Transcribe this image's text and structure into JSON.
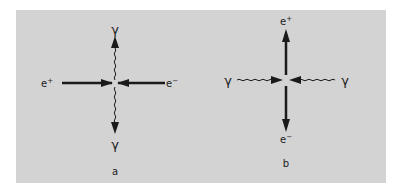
{
  "figure": {
    "background_color": "#d3d3d3",
    "ink_color": "#1a1a1a",
    "panels": [
      {
        "id": "a",
        "caption": "a",
        "description": "Electron-positron annihilation into two photons",
        "labels": {
          "left": "e",
          "left_sup": "+",
          "right": "e",
          "right_sup": "−",
          "top": "γ",
          "bottom": "γ"
        }
      },
      {
        "id": "b",
        "caption": "b",
        "description": "Two photons producing an electron-positron pair",
        "labels": {
          "left": "γ",
          "right": "γ",
          "top": "e",
          "top_sup": "+",
          "bottom": "e",
          "bottom_sup": "−"
        }
      }
    ]
  }
}
